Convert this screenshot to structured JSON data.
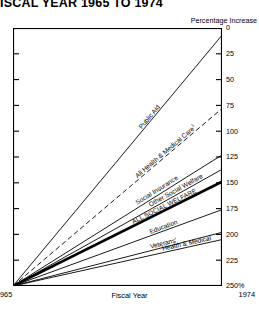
{
  "title": "ISCAL YEAR 1965 TO 1974",
  "axis_note": "Percentage Increase",
  "x_axis": {
    "title": "Fiscal Year",
    "start_label": "965",
    "end_label": "1974"
  },
  "y_ticks": [
    "250%",
    "225",
    "200",
    "175",
    "150",
    "125",
    "100",
    "75",
    "50",
    "25",
    "0"
  ],
  "chart_data": {
    "type": "line",
    "title": "ISCAL YEAR 1965 TO 1974",
    "xlabel": "Fiscal Year",
    "ylabel": "Percentage Increase",
    "x": [
      1965,
      1974
    ],
    "xlim": [
      1965,
      1974
    ],
    "ylim": [
      0,
      250
    ],
    "grid": false,
    "legend": "inline-labels",
    "yticks": [
      0,
      25,
      50,
      75,
      100,
      125,
      150,
      175,
      200,
      225,
      250
    ],
    "series": [
      {
        "name": "Public Aid",
        "values": [
          0,
          243
        ],
        "style": "solid",
        "width": "thin"
      },
      {
        "name": "All Health & Medical Care",
        "footnote": "1",
        "values": [
          0,
          172
        ],
        "style": "dashed",
        "width": "thin"
      },
      {
        "name": "Social Insurance",
        "values": [
          0,
          127
        ],
        "style": "solid",
        "width": "thin"
      },
      {
        "name": "Other Social Welfare",
        "values": [
          0,
          113
        ],
        "style": "solid",
        "width": "thin"
      },
      {
        "name": "ALL SOCIAL WELFARE",
        "values": [
          0,
          101
        ],
        "style": "solid",
        "width": "bold"
      },
      {
        "name": "Education",
        "values": [
          0,
          74
        ],
        "style": "solid",
        "width": "thin"
      },
      {
        "name": "Veterans'",
        "values": [
          0,
          52
        ],
        "style": "solid",
        "width": "thin"
      },
      {
        "name": "Health & Medical",
        "values": [
          0,
          45
        ],
        "style": "solid",
        "width": "thin"
      }
    ]
  }
}
